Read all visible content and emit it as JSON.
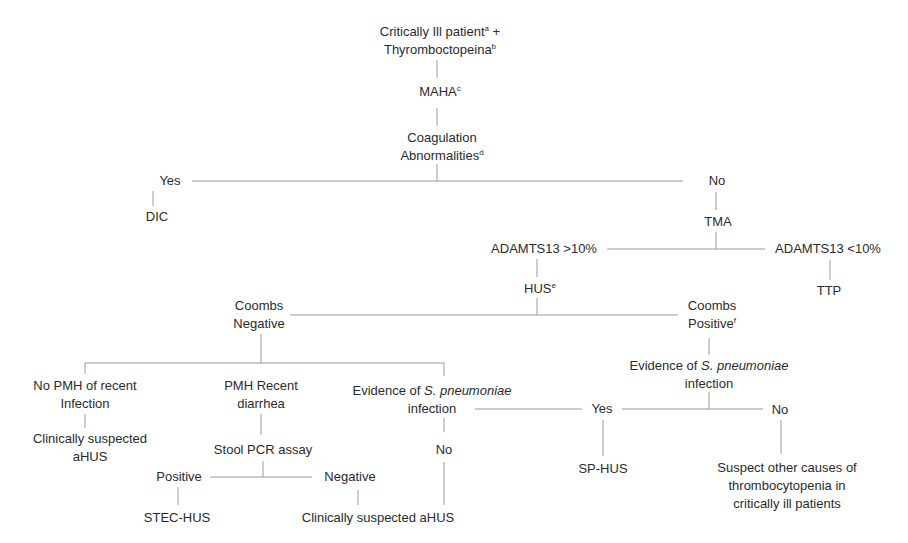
{
  "diagram": {
    "type": "decision-tree",
    "line_color": "#9a9a9a",
    "text_color": "#2b2b2b",
    "nodes": {
      "root_line1": "Critically Ill patient",
      "root_line1_sup": "a",
      "root_line1_suffix": " +",
      "root_line2": "Thyromboctopeina",
      "root_line2_sup": "b",
      "maha": "MAHA",
      "maha_sup": "c",
      "coag_line1": "Coagulation",
      "coag_line2": "Abnormalities",
      "coag_sup": "d",
      "yes1": "Yes",
      "dic": "DIC",
      "no1": "No",
      "tma": "TMA",
      "adamts_high": "ADAMTS13 >10%",
      "adamts_low": "ADAMTS13 <10%",
      "ttp": "TTP",
      "hus": "HUS",
      "hus_sup": "e",
      "coombs_neg_line1": "Coombs",
      "coombs_neg_line2": "Negative",
      "coombs_pos_line1": "Coombs",
      "coombs_pos_line2": "Positive",
      "coombs_pos_sup": "f",
      "evidence_right_line1_prefix": "Evidence of ",
      "evidence_right_line1_italic": "S. pneumoniae",
      "evidence_right_line2": "infection",
      "no_pmh_line1": "No PMH of recent",
      "no_pmh_line2": "Infection",
      "clin_susp_left_line1": "Clinically suspected",
      "clin_susp_left_line2": "aHUS",
      "pmh_diarrhea_line1": "PMH Recent",
      "pmh_diarrhea_line2": "diarrhea",
      "stool_pcr": "Stool PCR assay",
      "pcr_positive": "Positive",
      "pcr_negative": "Negative",
      "stec_hus": "STEC-HUS",
      "clin_susp_bottom": "Clinically suspected aHUS",
      "evidence_mid_line1_prefix": "Evidence of ",
      "evidence_mid_line1_italic": "S. pneumoniae",
      "evidence_mid_line2": "infection",
      "no_mid": "No",
      "yes2": "Yes",
      "no2": "No",
      "sp_hus": "SP-HUS",
      "other_causes_line1": "Suspect other causes of",
      "other_causes_line2": "thrombocytopenia in",
      "other_causes_line3": "critically ill patients"
    }
  }
}
